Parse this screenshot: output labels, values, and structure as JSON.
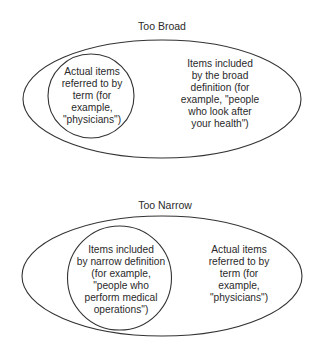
{
  "diagrams": [
    {
      "title": "Too Broad",
      "outer_label_lines": [
        "Items included",
        "by the broad",
        "definition (for",
        "example, \"people",
        "who look after",
        "your health\")"
      ],
      "inner_label_lines": [
        "Actual items",
        "referred to by",
        "term (for",
        "example,",
        "\"physicians\")"
      ]
    },
    {
      "title": "Too Narrow",
      "inner_label_lines": [
        "Items included",
        "by narrow definition",
        "(for example,",
        "\"people who",
        "perform medical",
        "operations\")"
      ],
      "outer_label_lines": [
        "Actual items",
        "referred to by",
        "term (for",
        "example,",
        "\"physicians\")"
      ]
    }
  ],
  "colors": {
    "stroke": "#333333",
    "text": "#2a2a2a",
    "background": "#ffffff"
  }
}
